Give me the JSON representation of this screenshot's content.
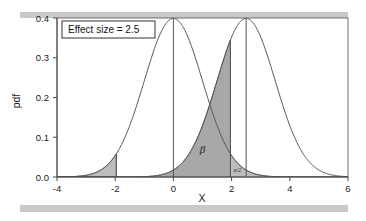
{
  "figure": {
    "name": "statistical-power-plot",
    "background_color": "#ffffff",
    "scan_band_color": "#c9c9c9"
  },
  "annotation": {
    "text": "Effect size = 2.5",
    "border_color": "#333333",
    "background_color": "#ffffff"
  },
  "labels": {
    "beta": "β",
    "alpha_half": "α/2"
  },
  "colors": {
    "curve_line": "#555555",
    "beta_fill": "#a8a8a8",
    "alpha_fill": "#bdbdbd",
    "axis": "#4a4a4a",
    "frame": "#6e6e6e",
    "text": "#1a1a1a"
  },
  "chart_data": {
    "type": "line",
    "title": "",
    "xlabel": "X",
    "ylabel": "pdf",
    "xlim": [
      -4,
      6
    ],
    "ylim": [
      0.0,
      0.4
    ],
    "xticks": [
      -4,
      -2,
      0,
      2,
      4,
      6
    ],
    "xtick_labels": [
      "-4",
      "-2",
      "0",
      "2",
      "4",
      "6"
    ],
    "yticks": [
      0.0,
      0.1,
      0.2,
      0.3,
      0.4
    ],
    "ytick_labels": [
      "0.0",
      "0.1",
      "0.2",
      "0.3",
      "0.4"
    ],
    "grid": false,
    "legend": "none",
    "series": [
      {
        "name": "null distribution",
        "distribution": "normal",
        "mean": 0,
        "sd": 1,
        "peak_value": 0.3989,
        "mean_line": true
      },
      {
        "name": "alternative distribution",
        "distribution": "normal",
        "mean": 2.5,
        "sd": 1,
        "peak_value": 0.3989,
        "mean_line": true
      }
    ],
    "shaded_regions": [
      {
        "name": "beta",
        "label": "β",
        "distribution": "alternative",
        "from": -4,
        "to": 1.96,
        "fill": "#a8a8a8",
        "label_x": 1.0,
        "label_y": 0.06
      },
      {
        "name": "alpha-half-upper",
        "label": "α/2",
        "distribution": "null",
        "from": 1.96,
        "to": 6,
        "fill": "#bdbdbd",
        "label_x": 2.2,
        "label_y": 0.012
      },
      {
        "name": "alpha-half-lower",
        "label": "",
        "distribution": "null",
        "from": -4,
        "to": -1.96,
        "fill": "#bdbdbd"
      }
    ],
    "critical_lines": [
      -1.96,
      1.96
    ],
    "annotations": [
      {
        "text": "Effect size = 2.5",
        "x": -3.55,
        "y": 0.385,
        "boxed": true
      }
    ]
  }
}
